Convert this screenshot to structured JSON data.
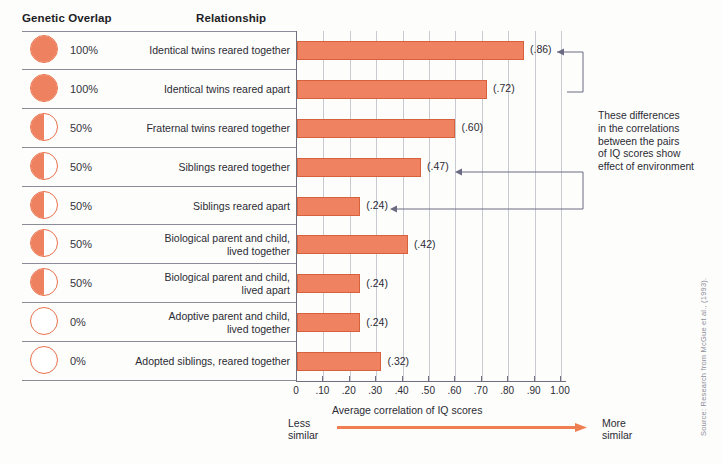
{
  "headers": {
    "genetic_overlap": "Genetic Overlap",
    "relationship": "Relationship"
  },
  "annotation": {
    "text": "These differences\nin the correlations\nbetween the pairs\nof IQ scores show\neffect of environment"
  },
  "axis": {
    "title": "Average correlation of IQ scores",
    "less_label": "Less\nsimilar",
    "more_label": "More\nsimilar",
    "ticks": [
      "0",
      ".10",
      ".20",
      ".30",
      ".40",
      ".50",
      ".60",
      ".70",
      ".80",
      ".90",
      "1.00"
    ],
    "tick_values": [
      0,
      0.1,
      0.2,
      0.3,
      0.4,
      0.5,
      0.6,
      0.7,
      0.8,
      0.9,
      1.0
    ]
  },
  "source": "Source: Research from McGue et al., (1993).",
  "colors": {
    "bar_fill": "#ef8260",
    "bar_stroke": "#d7613c",
    "circle_fill": "#ee8160",
    "circle_stroke": "#e8714a",
    "grid": "#c9c9d2",
    "axis": "#6f6f7d",
    "text": "#2b2b33"
  },
  "chart_data": {
    "type": "bar",
    "title": "",
    "xlabel": "Average correlation of IQ scores",
    "ylabel": "",
    "xlim": [
      0,
      1.0
    ],
    "grid": true,
    "legend": "none",
    "orientation": "horizontal",
    "categories": [
      "Identical twins reared together",
      "Identical twins reared apart",
      "Fraternal twins reared together",
      "Siblings reared together",
      "Siblings reared apart",
      "Biological parent and child,\nlived together",
      "Biological parent and child,\nlived apart",
      "Adoptive parent and child,\nlived together",
      "Adopted siblings, reared together"
    ],
    "values": [
      0.86,
      0.72,
      0.6,
      0.47,
      0.24,
      0.42,
      0.24,
      0.24,
      0.32
    ],
    "value_labels": [
      "(.86)",
      "(.72)",
      "(.60)",
      "(.47)",
      "(.24)",
      "(.42)",
      "(.24)",
      "(.24)",
      "(.32)"
    ],
    "genetic_overlap": [
      "100%",
      "100%",
      "50%",
      "50%",
      "50%",
      "50%",
      "50%",
      "0%",
      "0%"
    ],
    "genetic_overlap_fraction": [
      1,
      1,
      0.5,
      0.5,
      0.5,
      0.5,
      0.5,
      0,
      0
    ]
  },
  "rows": [
    {
      "pct": "100%",
      "fill": 1,
      "rel": "Identical twins reared together",
      "val": 0.86,
      "label": "(.86)"
    },
    {
      "pct": "100%",
      "fill": 1,
      "rel": "Identical twins reared apart",
      "val": 0.72,
      "label": "(.72)"
    },
    {
      "pct": "50%",
      "fill": 0.5,
      "rel": "Fraternal twins reared together",
      "val": 0.6,
      "label": "(.60)"
    },
    {
      "pct": "50%",
      "fill": 0.5,
      "rel": "Siblings reared together",
      "val": 0.47,
      "label": "(.47)"
    },
    {
      "pct": "50%",
      "fill": 0.5,
      "rel": "Siblings reared apart",
      "val": 0.24,
      "label": "(.24)"
    },
    {
      "pct": "50%",
      "fill": 0.5,
      "rel": "Biological parent and child,\nlived together",
      "val": 0.42,
      "label": "(.42)"
    },
    {
      "pct": "50%",
      "fill": 0.5,
      "rel": "Biological parent and child,\nlived apart",
      "val": 0.24,
      "label": "(.24)"
    },
    {
      "pct": "0%",
      "fill": 0,
      "rel": "Adoptive parent and child,\nlived together",
      "val": 0.24,
      "label": "(.24)"
    },
    {
      "pct": "0%",
      "fill": 0,
      "rel": "Adopted siblings, reared together",
      "val": 0.32,
      "label": "(.32)"
    }
  ]
}
